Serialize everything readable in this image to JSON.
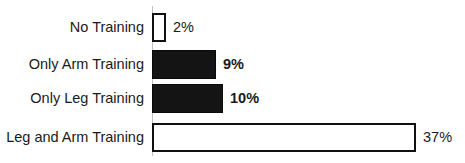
{
  "chart_data": {
    "type": "bar",
    "orientation": "horizontal",
    "title": "",
    "xlabel": "",
    "ylabel": "",
    "categories": [
      "No Training",
      "Only Arm Training",
      "Only Leg Training",
      "Leg and Arm Training"
    ],
    "values": [
      2,
      9,
      10,
      37
    ],
    "value_labels": [
      "2%",
      "9%",
      "10%",
      "37%"
    ],
    "bar_styles": [
      "outline",
      "filled",
      "filled",
      "outline"
    ],
    "label_bold": [
      false,
      true,
      true,
      false
    ],
    "unit": "%",
    "xlim": [
      0,
      37
    ],
    "grid": false,
    "legend": null,
    "colors": {
      "filled": "#141414",
      "outline_fill": "#ffffff",
      "outline_stroke": "#111111",
      "axis": "#bfbfbf"
    }
  }
}
